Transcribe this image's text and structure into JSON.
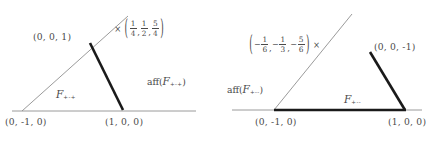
{
  "figure": {
    "type": "geometry-diagram",
    "ink_color": "#4a4a4a",
    "thick_edge_color": "#1a1a1a",
    "thin_line_color": "#9a9a9a"
  },
  "panels": [
    {
      "id": "left",
      "face_label": {
        "symbol": "F",
        "subscript": "+-+"
      },
      "aff_label": {
        "prefix": "aff(",
        "symbol": "F",
        "subscript": "+-+",
        "suffix": ")"
      },
      "vertices": [
        {
          "name": "apex",
          "label": "(0, 0, 1)"
        },
        {
          "name": "bottom-left",
          "label": "(0, -1, 0)"
        },
        {
          "name": "bottom-right",
          "label": "(1, 0, 0)"
        }
      ],
      "scalar": {
        "order": "times-first",
        "times": "×",
        "open": "(",
        "close": ")",
        "components": [
          {
            "sign": "",
            "num": "1",
            "den": "4"
          },
          {
            "sign": "",
            "num": "1",
            "den": "2"
          },
          {
            "sign": "",
            "num": "5",
            "den": "4"
          }
        ]
      }
    },
    {
      "id": "right",
      "face_label": {
        "symbol": "F",
        "subscript": "+--"
      },
      "aff_label": {
        "prefix": "aff(",
        "symbol": "F",
        "subscript": "+--",
        "suffix": ")"
      },
      "vertices": [
        {
          "name": "apex",
          "label": "(0, 0, -1)"
        },
        {
          "name": "bottom-left",
          "label": "(0, -1, 0)"
        },
        {
          "name": "bottom-right",
          "label": "(1, 0, 0)"
        }
      ],
      "scalar": {
        "order": "times-last",
        "times": "×",
        "open": "(",
        "close": ")",
        "components": [
          {
            "sign": "−",
            "num": "1",
            "den": "6"
          },
          {
            "sign": "−",
            "num": "1",
            "den": "3"
          },
          {
            "sign": "−",
            "num": "5",
            "den": "6"
          }
        ]
      }
    }
  ]
}
